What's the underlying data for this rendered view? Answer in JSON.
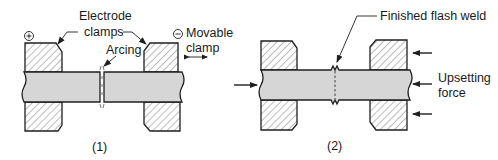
{
  "figure": {
    "panel1": {
      "caption": "(1)",
      "labels": {
        "electrode_line1": "Electrode",
        "electrode_line2": "clamps",
        "arcing": "Arcing",
        "movable_line1": "Movable",
        "movable_line2": "clamp",
        "positive_symbol": "+",
        "negative_symbol": "−"
      }
    },
    "panel2": {
      "caption": "(2)",
      "labels": {
        "finished_weld": "Finished flash weld",
        "upsetting_line1": "Upsetting",
        "upsetting_line2": "force"
      }
    },
    "colors": {
      "stroke": "#1f1f1f",
      "bar_fill": "#d6d6d6",
      "hatch": "#555555",
      "background": "#ffffff"
    }
  }
}
